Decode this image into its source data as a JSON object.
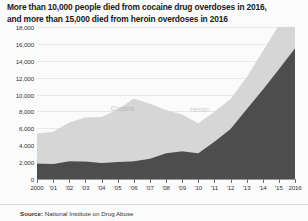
{
  "title": {
    "line1": "More than 10,000 people died from cocaine drug overdoses in 2016,",
    "line2": "and more than 15,000 died from heroin overdoses in 2016"
  },
  "source": {
    "prefix": "Source:",
    "text": "National Institute on Drug Abuse"
  },
  "labels": {
    "cocaine": "Cocaine",
    "heroin": "Heroin"
  },
  "chart_data": {
    "type": "area",
    "stacked": true,
    "title": "More than 10,000 people died from cocaine drug overdoses in 2016, and more than 15,000 died from heroin overdoses in 2016",
    "xlabel": "",
    "ylabel": "",
    "ylim": [
      0,
      18000
    ],
    "ytick_step": 2000,
    "grid": true,
    "legend": "inline-labels",
    "x": [
      2000,
      2001,
      2002,
      2003,
      2004,
      2005,
      2006,
      2007,
      2008,
      2009,
      2010,
      2011,
      2012,
      2013,
      2014,
      2015,
      2016
    ],
    "xtick_labels": [
      "2000",
      "'01",
      "'02",
      "'03",
      "'04",
      "'05",
      "'06",
      "'07",
      "'08",
      "'09",
      "'10",
      "'11",
      "'12",
      "'13",
      "'14",
      "'15",
      "2016"
    ],
    "ytick_labels": [
      "0",
      "2,000",
      "4,000",
      "6,000",
      "8,000",
      "10,000",
      "12,000",
      "14,000",
      "16,000",
      "18,000"
    ],
    "ytick_values": [
      0,
      2000,
      4000,
      6000,
      8000,
      10000,
      12000,
      14000,
      16000,
      18000
    ],
    "series": [
      {
        "name": "Heroin",
        "color": "#4d4d4d",
        "values": [
          1840,
          1780,
          2090,
          2080,
          1880,
          2010,
          2090,
          2400,
          3040,
          3280,
          3040,
          4400,
          5930,
          8260,
          10570,
          12990,
          15470
        ]
      },
      {
        "name": "Cocaine",
        "color": "#d6d6d6",
        "values": [
          3540,
          3830,
          4600,
          5200,
          5450,
          6210,
          7450,
          6510,
          5130,
          4350,
          3550,
          3560,
          3540,
          3790,
          4550,
          5220,
          5240
        ]
      }
    ],
    "stack_totals": [
      5380,
      5610,
      6690,
      7280,
      7330,
      8220,
      9540,
      8910,
      8170,
      7630,
      6590,
      7960,
      9470,
      12050,
      15120,
      18210,
      20710
    ],
    "colors": {
      "heroin": "#4d4d4d",
      "cocaine": "#d6d6d6",
      "grid": "#e8e8e8",
      "axis": "#9a9a9a",
      "background": "#fbfbfb",
      "text": "#1a1a1a"
    }
  }
}
